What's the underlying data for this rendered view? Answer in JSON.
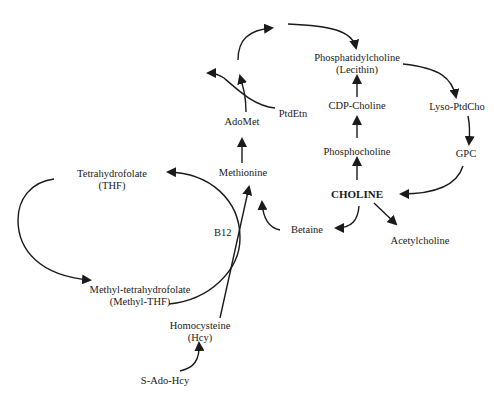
{
  "diagram": {
    "type": "metabolic-pathway",
    "nodes": {
      "phosphatidylcholine": {
        "line1": "Phosphatidylcholine",
        "line2": "(Lecithin)"
      },
      "cdp_choline": {
        "label": "CDP-Choline"
      },
      "phosphocholine": {
        "label": "Phosphocholine"
      },
      "choline": {
        "label": "CHOLINE"
      },
      "lyso_ptdcho": {
        "label": "Lyso-PtdCho"
      },
      "gpc": {
        "label": "GPC"
      },
      "acetylcholine": {
        "label": "Acetylcholine"
      },
      "betaine": {
        "label": "Betaine"
      },
      "methionine": {
        "label": "Methionine"
      },
      "adomet": {
        "label": "AdoMet"
      },
      "ptdetn": {
        "label": "PtdEtn"
      },
      "thf": {
        "line1": "Tetrahydrofolate",
        "line2": "(THF)"
      },
      "methyl_thf": {
        "line1": "Methyl-tetrahydrofolate",
        "line2": "(Methyl-THF)"
      },
      "homocysteine": {
        "line1": "Homocysteine",
        "line2": "(Hcy)"
      },
      "s_ado_hcy": {
        "label": "S-Ado-Hcy"
      }
    },
    "cofactor_label": "B12",
    "edges": [
      {
        "from": "CHOLINE",
        "to": "Phosphocholine"
      },
      {
        "from": "Phosphocholine",
        "to": "CDP-Choline"
      },
      {
        "from": "CDP-Choline",
        "to": "Phosphatidylcholine"
      },
      {
        "from": "Phosphatidylcholine",
        "to": "Lyso-PtdCho"
      },
      {
        "from": "Lyso-PtdCho",
        "to": "GPC"
      },
      {
        "from": "GPC",
        "to": "CHOLINE"
      },
      {
        "from": "CHOLINE",
        "to": "Acetylcholine"
      },
      {
        "from": "CHOLINE",
        "to": "Betaine"
      },
      {
        "from": "Betaine",
        "to": "Methionine"
      },
      {
        "from": "Homocysteine",
        "to": "Methionine",
        "via": "B12"
      },
      {
        "from": "Methyl-THF",
        "to": "THF",
        "via": "B12"
      },
      {
        "from": "THF",
        "to": "Methyl-THF"
      },
      {
        "from": "S-Ado-Hcy",
        "to": "Homocysteine"
      },
      {
        "from": "Methionine",
        "to": "AdoMet"
      },
      {
        "from": "AdoMet",
        "to": "Phosphatidylcholine",
        "via": "PtdEtn methylation"
      },
      {
        "from": "PtdEtn",
        "to": "methylated product"
      }
    ]
  }
}
